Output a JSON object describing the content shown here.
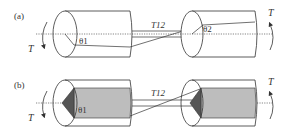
{
  "panels": [
    {
      "id": "a",
      "label": "(a)",
      "torque_left": "T",
      "torque_right": "T",
      "angle_left": "θ1",
      "angle_right": "θ2",
      "connector": "T12",
      "shaded": false
    },
    {
      "id": "b",
      "label": "(b)",
      "torque_left": "T",
      "torque_right": "T",
      "angle_left": "θ1",
      "connector": "T12",
      "shaded": true
    }
  ],
  "colors": {
    "line": "#333333",
    "fill_light": "#bdbdbd",
    "fill_dark": "#555555",
    "background": "#ffffff"
  }
}
